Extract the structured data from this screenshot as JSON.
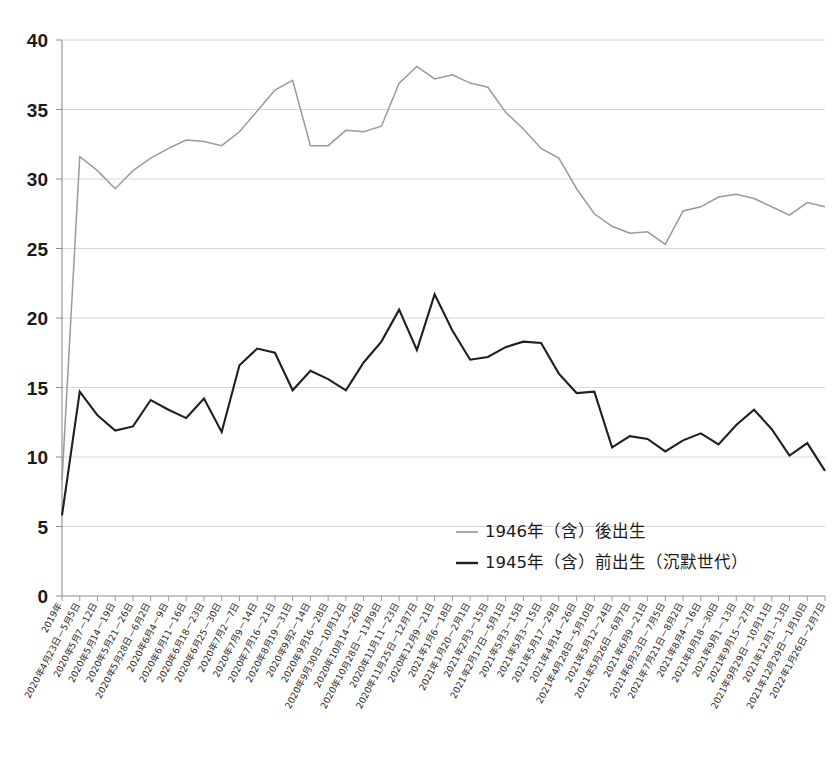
{
  "chart_data": {
    "type": "line",
    "title": "",
    "subtitle": "",
    "xlabel": "",
    "ylabel": "",
    "ylim": [
      0,
      40
    ],
    "yticks": [
      0,
      5,
      10,
      15,
      20,
      25,
      30,
      35,
      40
    ],
    "ytick_labels": [
      "0",
      "5",
      "10",
      "15",
      "20",
      "25",
      "30",
      "35",
      "40"
    ],
    "grid": true,
    "grid_axis": "y",
    "legend_position": "center-right-inside",
    "legend": [
      {
        "name": "1946年（含）後出生",
        "color": "#9a9a9a"
      },
      {
        "name": "1945年（含）前出生（沉默世代）",
        "color": "#1f1f1f"
      }
    ],
    "categories": [
      "2019年",
      "2020年4月23日－5月5日",
      "2020年5月7－12日",
      "2020年5月14－19日",
      "2020年5月21－26日",
      "2020年5月28日－6月2日",
      "2020年6月4－9日",
      "2020年6月11－16日",
      "2020年6月18－23日",
      "2020年6月25－30日",
      "2020年7月2－7日",
      "2020年7月9－14日",
      "2020年7月16－21日",
      "2020年8月19－31日",
      "2020年9月2－14日",
      "2020年9月16－28日",
      "2020年9月30日－10月12日",
      "2020年10月14－26日",
      "2020年10月28日－11月9日",
      "2020年11月11－23日",
      "2020年11月25日－12月7日",
      "2020年12月9－21日",
      "2021年1月6－18日",
      "2021年1月20－2月1日",
      "2021年2月3－15日",
      "2021年2月17日－5月1日",
      "2021年5月3－15日",
      "2021年5月3－15日",
      "2021年5月17－29日",
      "2021年4月14－26日",
      "2021年4月28日－5月10日",
      "2021年5月12－24日",
      "2021年5月26日－6月7日",
      "2021年6月9－21日",
      "2021年6月23日－7月5日",
      "2021年7月21日－8月2日",
      "2021年8月4－16日",
      "2021年8月18－30日",
      "2021年9月1－13日",
      "2021年9月15－27日",
      "2021年9月29日－10月11日",
      "2021年12月1－13日",
      "2021年12月29日－1月10日",
      "2022年1月26日－2月7日"
    ],
    "series": [
      {
        "name": "1946年（含）後出生",
        "color": "#9a9a9a",
        "values": [
          8.3,
          31.6,
          30.6,
          29.3,
          30.6,
          31.5,
          32.2,
          32.8,
          32.7,
          32.4,
          33.4,
          34.9,
          36.4,
          37.1,
          32.4,
          32.4,
          33.5,
          33.4,
          33.8,
          36.9,
          38.1,
          37.2,
          37.5,
          36.9,
          36.6,
          34.8,
          33.6,
          32.2,
          31.5,
          29.3,
          27.5,
          26.6,
          26.1,
          26.2,
          25.3,
          27.7,
          28.0,
          28.7,
          28.9,
          28.6,
          28.0,
          27.4,
          28.3,
          28.0
        ]
      },
      {
        "name": "1945年（含）前出生（沉默世代）",
        "color": "#1f1f1f",
        "values": [
          5.8,
          14.7,
          13.0,
          11.9,
          12.2,
          14.1,
          13.4,
          12.8,
          14.2,
          11.8,
          16.6,
          17.8,
          17.5,
          14.8,
          16.2,
          15.6,
          14.8,
          16.8,
          18.3,
          20.6,
          17.7,
          21.7,
          19.1,
          17.0,
          17.2,
          17.9,
          18.3,
          18.2,
          16.0,
          14.6,
          14.7,
          10.7,
          11.5,
          11.3,
          10.4,
          11.2,
          11.7,
          10.9,
          12.3,
          13.4,
          12.0,
          10.1,
          11.0,
          9.0
        ]
      }
    ]
  },
  "layout": {
    "plot_left": 62,
    "plot_right": 825,
    "plot_top": 40,
    "plot_bottom": 596
  }
}
